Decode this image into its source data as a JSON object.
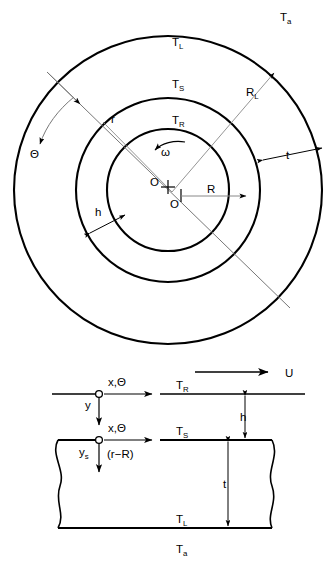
{
  "figure": {
    "background": "#ffffff",
    "stroke": "#000000",
    "thin_stroke": "#666666"
  },
  "top_view": {
    "name": "concentric-circle-cross-section",
    "center": {
      "x": 168,
      "y": 190
    },
    "circles": [
      {
        "name": "outer-circle",
        "radius": 154,
        "label": "T_L"
      },
      {
        "name": "middle-circle",
        "radius": 92,
        "label": "T_S"
      },
      {
        "name": "inner-circle",
        "radius": 61,
        "label": "T_R"
      }
    ],
    "labels": {
      "ambient": "T",
      "ambient_sub": "a",
      "outer_temp": "T",
      "outer_temp_sub": "L",
      "mid_temp": "T",
      "mid_temp_sub": "S",
      "inner_temp": "T",
      "inner_temp_sub": "R",
      "theta": "Θ",
      "omega": "ω",
      "radius_small": "r",
      "radius_large": "R",
      "radius_large_sub": "L",
      "thickness": "t",
      "film_gap": "h",
      "shaft_radius": "R",
      "origin_upper": "O",
      "origin_lower": "O"
    }
  },
  "side_view": {
    "name": "unwrapped-film-cross-section",
    "labels": {
      "velocity": "U",
      "axis_top": "x,Θ",
      "axis_bottom": "x,Θ",
      "y": "y",
      "y_s": "y",
      "y_s_sub": "s",
      "r_minus_R": "(r−R)",
      "surface_temp_top": "T",
      "surface_temp_top_sub": "R",
      "surface_temp_mid": "T",
      "surface_temp_mid_sub": "S",
      "surface_temp_low": "T",
      "surface_temp_low_sub": "L",
      "ambient": "T",
      "ambient_sub": "a",
      "film_gap": "h",
      "thickness": "t"
    }
  }
}
